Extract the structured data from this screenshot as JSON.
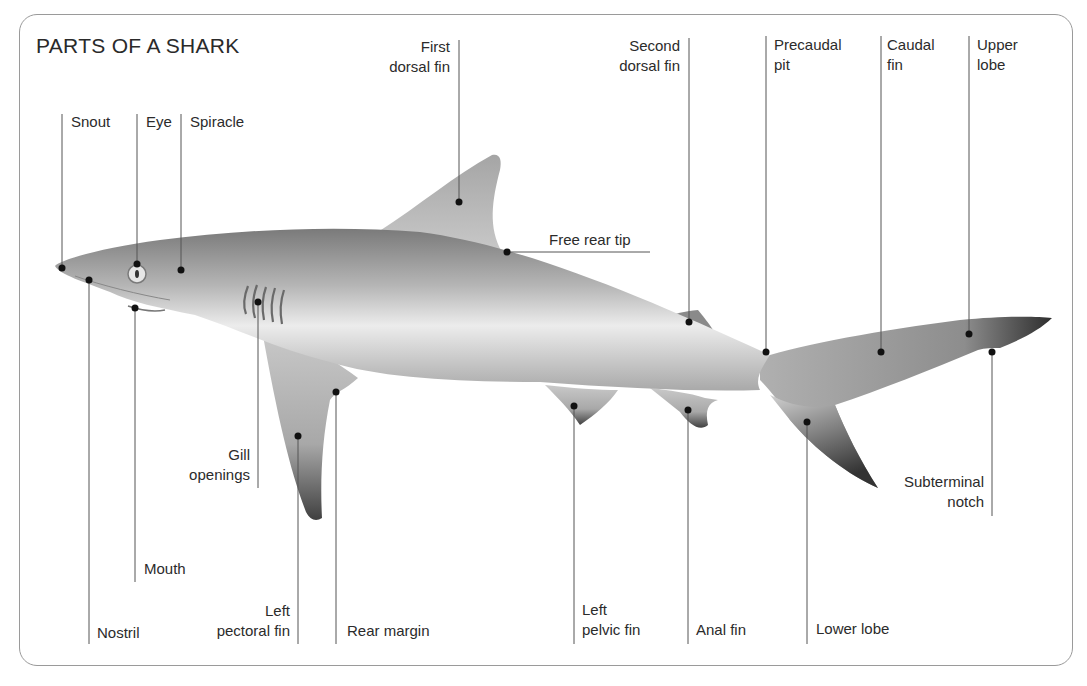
{
  "title": "PARTS OF A SHARK",
  "labels": {
    "snout": "Snout",
    "eye": "Eye",
    "spiracle": "Spiracle",
    "first_dorsal_fin_1": "First",
    "first_dorsal_fin_2": "dorsal fin",
    "second_dorsal_fin_1": "Second",
    "second_dorsal_fin_2": "dorsal fin",
    "precaudal_pit_1": "Precaudal",
    "precaudal_pit_2": "pit",
    "caudal_fin_1": "Caudal",
    "caudal_fin_2": "fin",
    "upper_lobe_1": "Upper",
    "upper_lobe_2": "lobe",
    "free_rear_tip": "Free rear tip",
    "gill_openings_1": "Gill",
    "gill_openings_2": "openings",
    "mouth": "Mouth",
    "nostril": "Nostril",
    "left_pectoral_fin_1": "Left",
    "left_pectoral_fin_2": "pectoral fin",
    "rear_margin": "Rear margin",
    "left_pelvic_fin_1": "Left",
    "left_pelvic_fin_2": "pelvic fin",
    "anal_fin": "Anal fin",
    "lower_lobe": "Lower lobe",
    "subterminal_notch_1": "Subterminal",
    "subterminal_notch_2": "notch"
  },
  "colors": {
    "frame": "#9a9a9a",
    "leader_line": "#555555",
    "dot": "#111111",
    "shark_dark": "#6e6e6e",
    "shark_light": "#efefef"
  }
}
